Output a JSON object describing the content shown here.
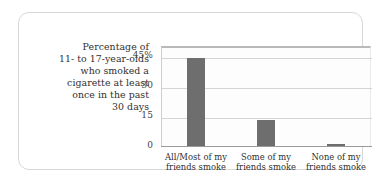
{
  "caption": {
    "lines": [
      "Percentage of",
      "11- to 17-year-olds",
      "who smoked a",
      "cigarette at least",
      "once in the past",
      "30 days"
    ]
  },
  "chart_data": {
    "type": "bar",
    "title": "",
    "xlabel": "",
    "ylabel": "Percentage of 11- to 17-year-olds who smoked a cigarette at least once in the past 30 days",
    "categories": [
      "All/Most of my friends smoke",
      "Some of my friends smoke",
      "None of my friends smoke"
    ],
    "category_lines": [
      [
        "All/Most of my",
        "friends smoke"
      ],
      [
        "Some of my",
        "friends smoke"
      ],
      [
        "None of my",
        "friends smoke"
      ]
    ],
    "values": [
      44,
      13,
      1
    ],
    "ylim": [
      0,
      50
    ],
    "yticks": [
      0,
      15,
      30,
      45
    ],
    "ytick_labels": [
      "0",
      "15",
      "30",
      "45%"
    ],
    "grid": true,
    "legend": "none",
    "bar_color": "#6e6e6e",
    "grid_color": "#d5d5d5",
    "axis_color": "#9a9a9a"
  }
}
